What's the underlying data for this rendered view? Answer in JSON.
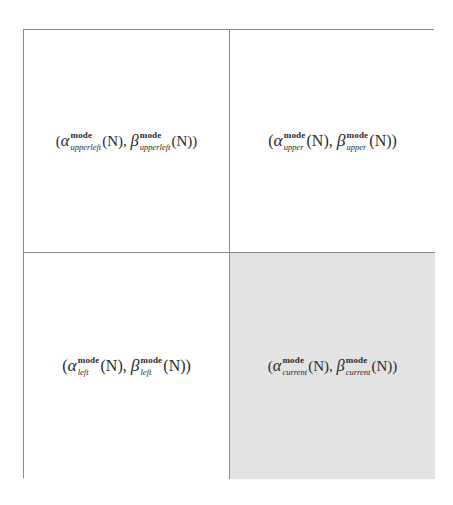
{
  "diagram": {
    "layout": "2x2 grid",
    "cells": [
      {
        "position": "upper-left",
        "shaded": false,
        "open": "(",
        "alpha": "α",
        "beta": "β",
        "superscript": "mode",
        "subscript": "upperleft",
        "arg": "(N)",
        "sep": ", ",
        "close": ")"
      },
      {
        "position": "upper-right",
        "shaded": false,
        "open": "(",
        "alpha": "α",
        "beta": "β",
        "superscript": "mode",
        "subscript": "upper",
        "arg": "(N)",
        "sep": ", ",
        "close": ")"
      },
      {
        "position": "lower-left",
        "shaded": false,
        "open": "(",
        "alpha": "α",
        "beta": "β",
        "superscript": "mode",
        "subscript": "left",
        "arg": "(N)",
        "sep": ", ",
        "close": ")"
      },
      {
        "position": "lower-right",
        "shaded": true,
        "open": "(",
        "alpha": "α",
        "beta": "β",
        "superscript": "mode",
        "subscript": "current",
        "arg": "(N)",
        "sep": ", ",
        "close": ")"
      }
    ],
    "colors": {
      "border": "#8a8a8a",
      "shaded_cell": "#e3e3e3",
      "background": "#ffffff",
      "text": "#2a2a2a"
    }
  }
}
